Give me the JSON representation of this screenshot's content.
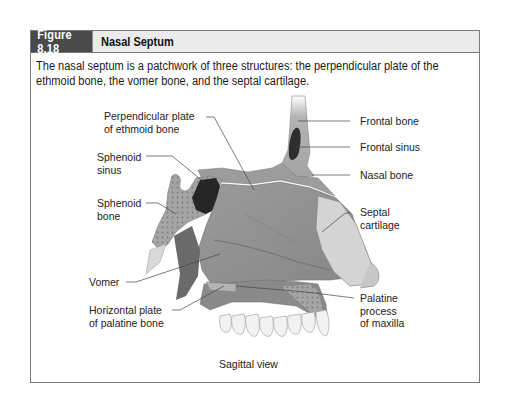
{
  "figure": {
    "number": "Figure 8.18",
    "title": "Nasal Septum",
    "caption": "The nasal septum is a patchwork of three structures: the perpendicular plate of the ethmoid bone, the vomer bone, and the septal cartilage.",
    "view_label": "Sagittal view"
  },
  "labels": {
    "perpendicular_plate": "Perpendicular plate\nof ethmoid bone",
    "sphenoid_sinus": "Sphenoid\nsinus",
    "sphenoid_bone": "Sphenoid\nbone",
    "vomer": "Vomer",
    "horizontal_plate": "Horizontal plate\nof palatine bone",
    "frontal_bone": "Frontal bone",
    "frontal_sinus": "Frontal sinus",
    "nasal_bone": "Nasal bone",
    "septal_cartilage": "Septal\ncartilage",
    "palatine_process": "Palatine\nprocess\nof maxilla"
  },
  "colors": {
    "header_dark": "#4a4a4a",
    "header_light": "#ebebeb",
    "border": "#7a7a7a",
    "bone": "#a9a9a9",
    "septum": "#8e8e8e",
    "cartilage": "#d6d6d6",
    "sinus": "#2b2b2b"
  }
}
